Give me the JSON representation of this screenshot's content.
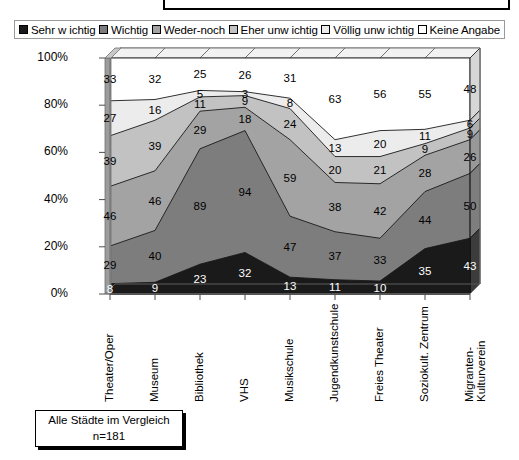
{
  "legend": {
    "items": [
      {
        "label": "Sehr w ichtig",
        "color": "#1a1a1a",
        "swatch": "legend-swatch-sehr-wichtig"
      },
      {
        "label": "Wichtig",
        "color": "#7d7d7d",
        "swatch": "legend-swatch-wichtig"
      },
      {
        "label": "Weder-noch",
        "color": "#a3a3a3",
        "swatch": "legend-swatch-weder-noch"
      },
      {
        "label": "Eher unw ichtig",
        "color": "#c2c2c2",
        "swatch": "legend-swatch-eher-unwichtig"
      },
      {
        "label": "Völlig unw ichtig",
        "color": "#ececec",
        "swatch": "legend-swatch-voellig-unwichtig"
      },
      {
        "label": "Keine Angabe",
        "color": "#ffffff",
        "swatch": "legend-swatch-keine-angabe"
      }
    ]
  },
  "axis": {
    "y_ticks": [
      "100%",
      "80%",
      "60%",
      "40%",
      "20%",
      "0%"
    ],
    "y_values": [
      100,
      80,
      60,
      40,
      20,
      0
    ]
  },
  "caption": {
    "line1": "Alle Städte im Vergleich",
    "line2": "n=181"
  },
  "chart_data": {
    "type": "area",
    "title": "",
    "subtitle": "",
    "xlabel": "",
    "ylabel": "",
    "ylim": [
      0,
      100
    ],
    "grid": false,
    "stacked": true,
    "legend_position": "top",
    "categories": [
      "Theater/Oper",
      "Museum",
      "Bibliothek",
      "VHS",
      "Musikschule",
      "Jugendkunstschule",
      "Freies Theater",
      "Soziokult. Zentrum",
      "Migranten-\nKulturverein"
    ],
    "series": [
      {
        "name": "Sehr w ichtig",
        "color": "#1a1a1a",
        "values": [
          8,
          9,
          23,
          32,
          13,
          11,
          10,
          35,
          43
        ]
      },
      {
        "name": "Wichtig",
        "color": "#7d7d7d",
        "values": [
          29,
          40,
          89,
          94,
          47,
          37,
          33,
          44,
          50
        ]
      },
      {
        "name": "Weder-noch",
        "color": "#a3a3a3",
        "values": [
          46,
          46,
          29,
          18,
          59,
          38,
          42,
          28,
          26
        ]
      },
      {
        "name": "Eher unw ichtig",
        "color": "#c2c2c2",
        "values": [
          39,
          39,
          11,
          9,
          24,
          20,
          21,
          9,
          9
        ]
      },
      {
        "name": "Völlig unw ichtig",
        "color": "#ececec",
        "values": [
          27,
          16,
          5,
          3,
          8,
          13,
          20,
          11,
          6
        ]
      },
      {
        "name": "Keine Angabe",
        "color": "#ffffff",
        "values": [
          33,
          32,
          25,
          26,
          31,
          63,
          56,
          55,
          48
        ]
      }
    ]
  }
}
